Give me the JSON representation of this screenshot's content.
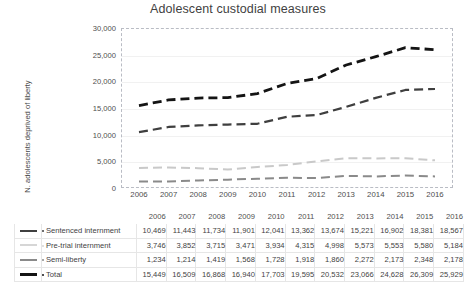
{
  "chart_data": {
    "type": "line",
    "title": "Adolescent custodial measures",
    "xlabel": "",
    "ylabel": "N. adolescents deprived of liberty",
    "categories": [
      "2006",
      "2007",
      "2008",
      "2009",
      "2010",
      "2011",
      "2012",
      "2013",
      "2014",
      "2015",
      "2016"
    ],
    "ylim": [
      0,
      30000
    ],
    "yticks": [
      "0",
      "5,000",
      "10,000",
      "15,000",
      "20,000",
      "25,000",
      "30,000"
    ],
    "ytick_values": [
      0,
      5000,
      10000,
      15000,
      20000,
      25000,
      30000
    ],
    "grid": true,
    "legend": "table",
    "line_style": "dashed",
    "series": [
      {
        "name": "Sentenced internment",
        "color": "#3f3f3f",
        "width": 2.2,
        "values": [
          10469,
          11443,
          11734,
          11901,
          12041,
          13362,
          13674,
          15221,
          16902,
          18381,
          18567
        ],
        "labels": [
          "10,469",
          "11,443",
          "11,734",
          "11,901",
          "12,041",
          "13,362",
          "13,674",
          "15,221",
          "16,902",
          "18,381",
          "18,567"
        ]
      },
      {
        "name": "Pre-trial internment",
        "color": "#c9c9c9",
        "width": 2.0,
        "values": [
          3746,
          3852,
          3715,
          3471,
          3934,
          4315,
          4998,
          5573,
          5553,
          5580,
          5184
        ],
        "labels": [
          "3,746",
          "3,852",
          "3,715",
          "3,471",
          "3,934",
          "4,315",
          "4,998",
          "5,573",
          "5,553",
          "5,580",
          "5,184"
        ]
      },
      {
        "name": "Semi-liberty",
        "color": "#8a8a8a",
        "width": 2.0,
        "values": [
          1234,
          1214,
          1419,
          1568,
          1728,
          1918,
          1860,
          2272,
          2173,
          2348,
          2178
        ],
        "labels": [
          "1,234",
          "1,214",
          "1,419",
          "1,568",
          "1,728",
          "1,918",
          "1,860",
          "2,272",
          "2,173",
          "2,348",
          "2,178"
        ]
      },
      {
        "name": "Total",
        "color": "#141414",
        "width": 2.8,
        "values": [
          15449,
          16509,
          16868,
          16940,
          17703,
          19595,
          20532,
          23066,
          24628,
          26309,
          25929
        ],
        "labels": [
          "15,449",
          "16,509",
          "16,868",
          "16,940",
          "17,703",
          "19,595",
          "20,532",
          "23,066",
          "24,628",
          "26,309",
          "25,929"
        ]
      }
    ]
  },
  "table": {
    "header": [
      "2006",
      "2007",
      "2008",
      "2009",
      "2010",
      "2011",
      "2012",
      "2013",
      "2014",
      "2015",
      "2016"
    ],
    "rows": [
      {
        "label": "Sentenced internment",
        "swatch_color": "#3f3f3f",
        "swatch_thickness": 2,
        "marker": true,
        "values": [
          "10,469",
          "11,443",
          "11,734",
          "11,901",
          "12,041",
          "13,362",
          "13,674",
          "15,221",
          "16,902",
          "18,381",
          "18,567"
        ]
      },
      {
        "label": "Pre-trial internment",
        "swatch_color": "#d6d6d6",
        "swatch_thickness": 2,
        "marker": true,
        "values": [
          "3,746",
          "3,852",
          "3,715",
          "3,471",
          "3,934",
          "4,315",
          "4,998",
          "5,573",
          "5,553",
          "5,580",
          "5,184"
        ]
      },
      {
        "label": "Semi-liberty",
        "swatch_color": "#8a8a8a",
        "swatch_thickness": 2,
        "marker": true,
        "values": [
          "1,234",
          "1,214",
          "1,419",
          "1,568",
          "1,728",
          "1,918",
          "1,860",
          "2,272",
          "2,173",
          "2,348",
          "2,178"
        ]
      },
      {
        "label": "Total",
        "swatch_color": "#141414",
        "swatch_thickness": 3,
        "marker": true,
        "values": [
          "15,449",
          "16,509",
          "16,868",
          "16,940",
          "17,703",
          "19,595",
          "20,532",
          "23,066",
          "24,628",
          "26,309",
          "25,929"
        ]
      }
    ]
  },
  "colors": {
    "grid": "#f1f1f1",
    "frame": "#b9bcc4",
    "text": "#3f3f3f",
    "table_border": "#e6e6e6"
  }
}
